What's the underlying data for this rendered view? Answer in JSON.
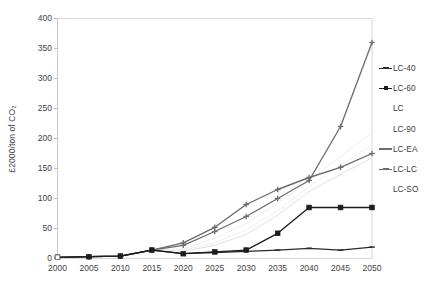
{
  "chart_data": {
    "type": "line",
    "title": "",
    "xlabel": "",
    "ylabel": "£2000/ton of CO₂",
    "x": [
      2000,
      2005,
      2010,
      2015,
      2020,
      2025,
      2030,
      2035,
      2040,
      2045,
      2050
    ],
    "xlim": [
      2000,
      2050
    ],
    "ylim": [
      0,
      400
    ],
    "yticks": [
      0,
      50,
      100,
      150,
      200,
      250,
      300,
      350,
      400
    ],
    "xticks": [
      "2000",
      "2005",
      "2010",
      "2015",
      "2020",
      "2025",
      "2030",
      "2035",
      "2040",
      "2045",
      "2050"
    ],
    "ytick_labels": [
      "0",
      "50",
      "100",
      "150",
      "200",
      "250",
      "300",
      "350",
      "400"
    ],
    "grid": false,
    "legend_position": "right",
    "series": [
      {
        "name": "LC-40",
        "color": "#2b2b2b",
        "marker": "dash",
        "values": [
          2,
          3,
          4,
          14,
          8,
          10,
          12,
          14,
          17,
          14,
          19
        ]
      },
      {
        "name": "LC-60",
        "color": "#1d1d1d",
        "marker": "square",
        "values": [
          2,
          3,
          4,
          14,
          8,
          11,
          14,
          42,
          85,
          85,
          85
        ]
      },
      {
        "name": "LC",
        "color": "#e2e2e2",
        "marker": "none",
        "values": [
          2,
          3,
          4,
          14,
          12,
          22,
          40,
          72,
          112,
          140,
          168
        ]
      },
      {
        "name": "LC-90",
        "color": "#eeeeee",
        "marker": "none",
        "values": [
          2,
          3,
          4,
          14,
          16,
          34,
          58,
          92,
          130,
          170,
          210
        ]
      },
      {
        "name": "LC-EA",
        "color": "#6e6e6e",
        "marker": "cross",
        "values": [
          2,
          3,
          4,
          14,
          22,
          45,
          70,
          100,
          130,
          220,
          360
        ]
      },
      {
        "name": "LC-LC",
        "color": "#6a6a6a",
        "marker": "cross",
        "values": [
          2,
          3,
          4,
          14,
          26,
          52,
          90,
          115,
          135,
          152,
          175
        ]
      },
      {
        "name": "LC-SO",
        "color": "#f0f0f0",
        "marker": "none",
        "values": [
          2,
          3,
          4,
          14,
          14,
          26,
          48,
          80,
          120,
          155,
          190
        ]
      }
    ]
  },
  "legend": {
    "items": [
      {
        "label": "LC-40"
      },
      {
        "label": "LC-60"
      },
      {
        "label": "LC"
      },
      {
        "label": "LC-90"
      },
      {
        "label": "LC-EA"
      },
      {
        "label": "LC-LC"
      },
      {
        "label": "LC-SO"
      }
    ]
  },
  "colors": {
    "frame": "#d8d8d8",
    "text": "#3f3f3f",
    "background": "#ffffff"
  }
}
